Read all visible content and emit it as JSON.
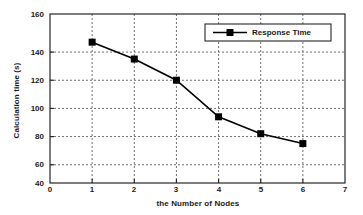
{
  "chart_data": {
    "type": "line",
    "title": "",
    "subtitle": "",
    "xlabel": "the Number of Nodes",
    "ylabel": "Calculation time (s)",
    "xlim": [
      0,
      7
    ],
    "ylim": [
      40,
      160
    ],
    "xticks": [
      "0",
      "1",
      "2",
      "3",
      "4",
      "5",
      "6",
      "7"
    ],
    "yticks": [
      "40",
      "60",
      "80",
      "100",
      "120",
      "140",
      "160"
    ],
    "grid": true,
    "grid_style": "dotted",
    "legend_position": "top-right",
    "x": [
      1,
      2,
      3,
      4,
      5,
      6
    ],
    "series": [
      {
        "name": "Response Time",
        "values": [
          140,
          128,
          113,
          87,
          75,
          68
        ],
        "marker": "square",
        "color": "#000000",
        "line_width": 1.6
      }
    ],
    "annotations": []
  },
  "legend": {
    "entries": [
      {
        "label": "Response Time"
      }
    ]
  },
  "colors": {
    "line": "#000000",
    "marker": "#000000",
    "axis": "#262626",
    "grid": "#808080",
    "background": "#ffffff",
    "text": "#1a1a1a"
  }
}
